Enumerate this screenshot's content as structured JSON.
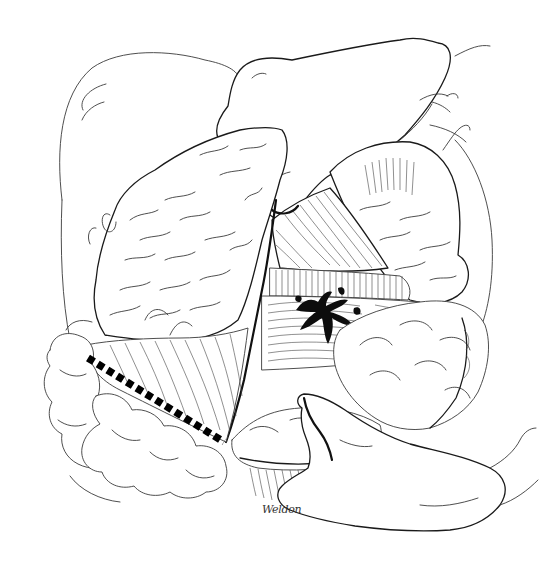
{
  "illustration": {
    "title": "Surgical illustration: exposure of mesentery with resection line",
    "style": "pen-and-ink line drawing",
    "background_color": "#ffffff",
    "ink_color": "#111111",
    "signature": "Weldon",
    "elements": [
      {
        "name": "upper-retracting-hand",
        "description": "hand reaching down from top center holding back tissue"
      },
      {
        "name": "lower-hand",
        "description": "hand in lower right supporting bowel loops"
      },
      {
        "name": "left-tissue-flap",
        "description": "large reflected organ/omentum flap on the left"
      },
      {
        "name": "right-upper-organ",
        "description": "tissue mass in upper right"
      },
      {
        "name": "mesentery-fan",
        "description": "striated mesentery in center"
      },
      {
        "name": "vascular-pattern",
        "description": "dark branching vessel pattern at center"
      },
      {
        "name": "bowel-loops",
        "description": "rounded intestinal loops along lower left and bottom"
      },
      {
        "name": "resection-line",
        "description": "bold black dashed line along lower left mesentery"
      }
    ],
    "resection_line": {
      "x1": 88,
      "y1": 358,
      "x2": 224,
      "y2": 442,
      "dash_count": 15
    }
  }
}
